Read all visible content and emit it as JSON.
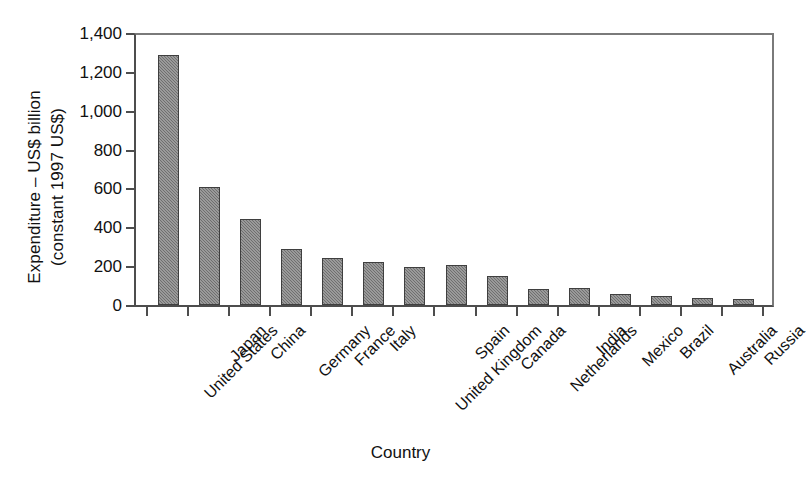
{
  "chart_data": {
    "type": "bar",
    "title": "",
    "xlabel": "Country",
    "ylabel": "Expenditure – US$ billion\n(constant 1997 US$)",
    "ylim": [
      0,
      1400
    ],
    "ytick_labels": [
      "0",
      "200",
      "400",
      "600",
      "800",
      "1,000",
      "1,200",
      "1,400"
    ],
    "ytick_values": [
      0,
      200,
      400,
      600,
      800,
      1000,
      1200,
      1400
    ],
    "grid": false,
    "legend": "none",
    "categories": [
      "United States",
      "Japan",
      "China",
      "Germany",
      "France",
      "Italy",
      "United Kingdom",
      "Spain",
      "Canada",
      "Netherlands",
      "India",
      "Mexico",
      "Brazil",
      "Australia",
      "Russia"
    ],
    "values": [
      1285,
      605,
      443,
      290,
      240,
      222,
      197,
      205,
      148,
      80,
      88,
      55,
      45,
      35,
      33
    ],
    "bar_color": "#6f6f6f",
    "bar_border_color": "#3f3f3f",
    "axis_color": "#4d4d4d",
    "background_color": "#ffffff"
  }
}
